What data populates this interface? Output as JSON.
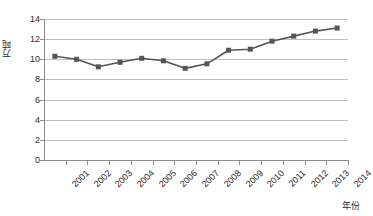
{
  "chart_data": {
    "type": "line",
    "title": "",
    "xlabel": "年份",
    "ylabel": "万吨",
    "categories": [
      "2001",
      "2002",
      "2003",
      "2004",
      "2005",
      "2006",
      "2007",
      "2008",
      "2009",
      "2010",
      "2011",
      "2012",
      "2013",
      "2014"
    ],
    "values": [
      10.3,
      10.0,
      9.25,
      9.7,
      10.1,
      9.85,
      9.1,
      9.55,
      10.9,
      11.0,
      11.8,
      12.3,
      12.8,
      13.1
    ],
    "ylim": [
      0,
      14
    ],
    "ytick_values": [
      0,
      2,
      4,
      6,
      8,
      10,
      12,
      14
    ],
    "ytick_labels": [
      "0",
      "2",
      "4",
      "6",
      "8",
      "10",
      "12",
      "14"
    ],
    "grid": true,
    "grid_axis": "y",
    "legend": false,
    "legend_position": "none",
    "series_color": "#555555",
    "marker": "square",
    "marker_size": 5,
    "gridline_color": "#bfbfbf",
    "axis_color": "#8c8c8c",
    "background_color": "#ffffff",
    "text_color": "#2b2b2b"
  }
}
